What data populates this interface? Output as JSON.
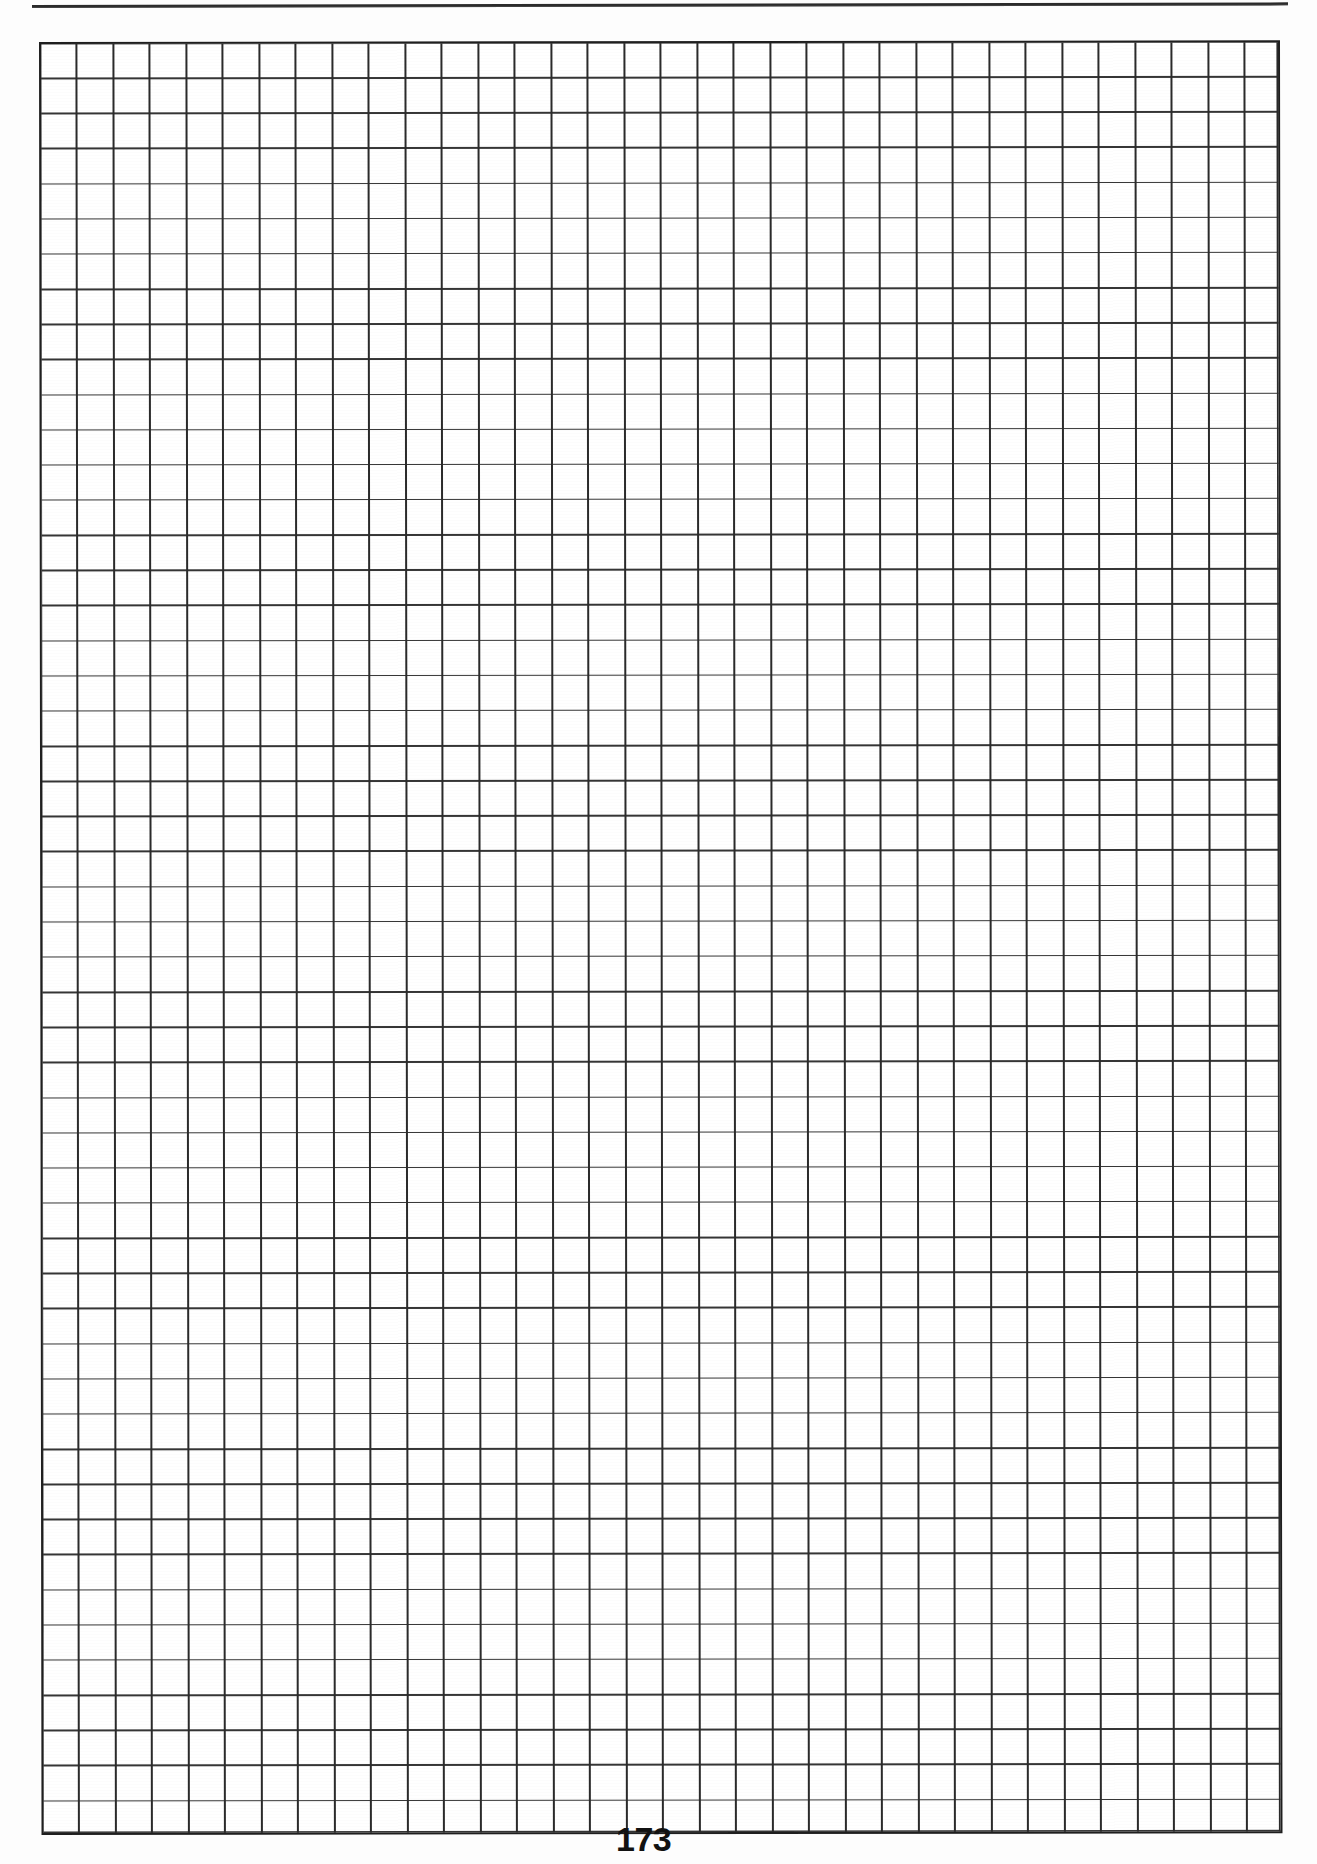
{
  "document": {
    "type": "scanned-book-page",
    "page_number": "173",
    "background_color": "#fdfdfd",
    "content_description": "blank-grid-paper"
  },
  "header": {
    "rule": {
      "name": "horizontal-rule",
      "color": "#2b2b2b"
    }
  },
  "grid": {
    "name": "graph-paper-grid",
    "columns": 34,
    "rows": 51,
    "cell_width_px": 36.5,
    "cell_height_px": 35.15,
    "line_color": "#2a2a2a",
    "border_color": "#1f1f1f",
    "fill_color": "#ffffff",
    "cells": []
  },
  "footer": {
    "page_number_label": "173"
  }
}
